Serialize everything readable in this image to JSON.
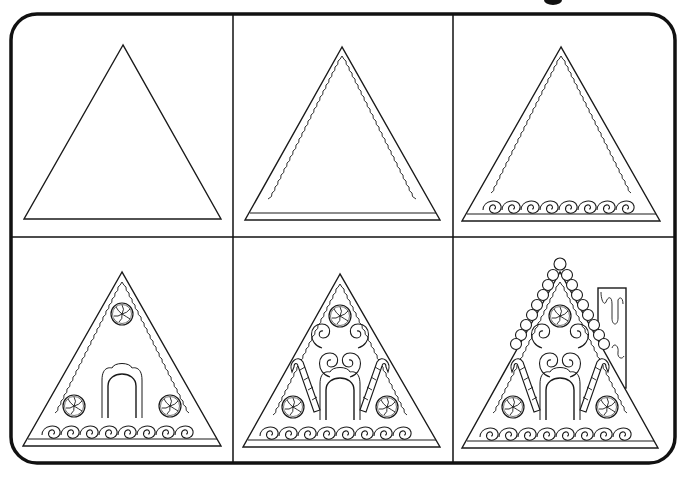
{
  "page": {
    "title_fragment_visible": true
  },
  "colors": {
    "background": "#ffffff",
    "ink": "#1a1a1a",
    "frame": "#111111"
  },
  "grid": {
    "rows": 2,
    "columns": 3,
    "frame": {
      "x": 10,
      "y": 13,
      "width": 666,
      "height": 451,
      "corner_radius": 26
    },
    "column_dividers_x": [
      233,
      453
    ],
    "row_divider_y": 237
  },
  "steps": [
    {
      "step": 1,
      "label": "Step 1",
      "description": "Plain triangle outline"
    },
    {
      "step": 2,
      "label": "Step 2",
      "description": "Inner wavy icing border and base strip"
    },
    {
      "step": 3,
      "label": "Step 3",
      "description": "Row of swirl decorations along the base"
    },
    {
      "step": 4,
      "label": "Step 4",
      "description": "Arched door and three peppermint candies"
    },
    {
      "step": 5,
      "label": "Step 5",
      "description": "Swirls and two candy canes"
    },
    {
      "step": 6,
      "label": "Step 6",
      "description": "Gumdrop roof trim and chimney with dripping icing"
    }
  ]
}
